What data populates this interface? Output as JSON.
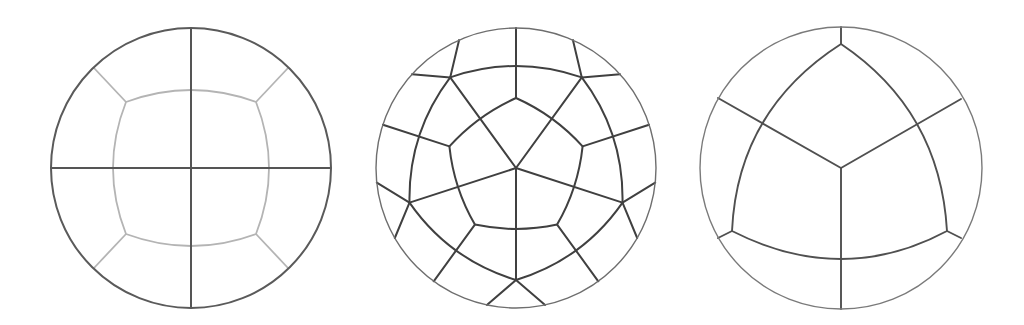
{
  "figure": {
    "panels": [
      {
        "id": "four-quadrant-partition",
        "center": [
          191,
          168
        ],
        "radius": 140,
        "colors": {
          "outer": "#5a5a5a",
          "cross": "#555555",
          "inner": "#b4b4b4"
        },
        "cross_lines": [
          [
            191,
            28,
            191,
            308
          ],
          [
            51,
            168,
            331,
            168
          ]
        ],
        "inner_curve": "M126,102 Q191,78 256,102 Q282,168 256,234 Q191,258 126,234 Q100,168 126,102 Z",
        "corner_spokes": [
          [
            126,
            102,
            94,
            68
          ],
          [
            256,
            102,
            288,
            68
          ],
          [
            256,
            234,
            288,
            268
          ],
          [
            126,
            234,
            94,
            268
          ]
        ]
      },
      {
        "id": "pentagonal-partition",
        "center": [
          516,
          168
        ],
        "radius": 140,
        "colors": {
          "outer": "#6e6e6e",
          "lines": "#404040"
        },
        "pentagon": "M516,98 Q554.5,115.2 582.6,146.4 Q578.2,188.3 557.1,224.6 Q516,233.4 474.9,224.6 Q453.8,188.3 449.4,146.4 Q477.5,115.2 516,98 Z",
        "middle_ring": "M450.2,77.4 Q516,54.6 581.8,77.4 Q623.85,133 622.5,202.6 Q582.75,259.7 516,280 Q449.25,259.7 409.5,202.6 Q408.15,133 450.2,77.4 Z",
        "lines": [
          [
            516,
            168,
            450.2,
            77.4
          ],
          [
            516,
            168,
            581.8,
            77.4
          ],
          [
            516,
            168,
            622.5,
            202.6
          ],
          [
            516,
            168,
            516,
            280
          ],
          [
            516,
            168,
            409.5,
            202.6
          ],
          [
            450.2,
            77.4,
            459.1,
            40.1
          ],
          [
            450.2,
            77.4,
            412,
            74.3
          ],
          [
            581.8,
            77.4,
            620,
            74.3
          ],
          [
            581.8,
            77.4,
            572.9,
            40.1
          ],
          [
            622.5,
            202.6,
            655.2,
            182.6
          ],
          [
            622.5,
            202.6,
            637.2,
            238
          ],
          [
            516,
            280,
            545.1,
            304.9
          ],
          [
            516,
            280,
            486.9,
            304.9
          ],
          [
            409.5,
            202.6,
            376.8,
            182.6
          ],
          [
            409.5,
            202.6,
            394.8,
            238
          ],
          [
            516,
            98,
            516,
            28
          ],
          [
            582.6,
            146.4,
            649.1,
            124.7
          ],
          [
            557.1,
            224.6,
            598.3,
            281.3
          ],
          [
            474.9,
            224.6,
            433.7,
            281.3
          ],
          [
            449.4,
            146.4,
            382.9,
            124.7
          ]
        ]
      },
      {
        "id": "three-sector-partition",
        "center": [
          841,
          168
        ],
        "radius": 141,
        "colors": {
          "outer": "#7a7a7a",
          "lines": "#505050"
        },
        "curved_triangle": "M841,44 Q737.5,110.5 732,231 Q842.5,287 947,231 Q940,110.5 841,44 Z",
        "lines": [
          [
            841,
            168,
            718,
            98
          ],
          [
            841,
            168,
            961,
            99
          ],
          [
            841,
            168,
            841,
            309
          ],
          [
            841,
            44,
            841,
            27
          ],
          [
            732,
            231,
            718,
            238
          ],
          [
            947,
            231,
            961,
            238
          ]
        ]
      }
    ]
  }
}
